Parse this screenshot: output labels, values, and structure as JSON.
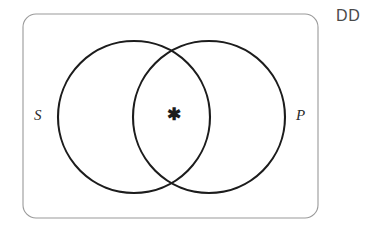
{
  "diagram": {
    "type": "venn-two-set",
    "title_label": "DD",
    "background_color": "#ffffff",
    "universe": {
      "label": "DD",
      "shape": "rounded-rectangle",
      "stroke_color": "#9a9a9a",
      "x": 23,
      "y": 14,
      "width": 295,
      "height": 204,
      "corner_radius": 13,
      "label_x": 336,
      "label_y": 17
    },
    "sets": [
      {
        "id": "S",
        "label": "S",
        "cx": 134,
        "cy": 117,
        "r": 76,
        "stroke_color": "#1c1c1c",
        "label_x": 34,
        "label_y": 117,
        "label_anchor": "start"
      },
      {
        "id": "P",
        "label": "P",
        "cx": 209,
        "cy": 117,
        "r": 76,
        "stroke_color": "#1c1c1c",
        "label_x": 296,
        "label_y": 117,
        "label_anchor": "start"
      }
    ],
    "markers": [
      {
        "id": "intersection-asterisk",
        "symbol": "✱",
        "region": "S-and-P",
        "x": 174,
        "y": 115,
        "color": "#1c1c1c"
      }
    ]
  }
}
